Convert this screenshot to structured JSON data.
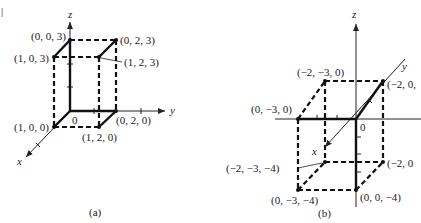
{
  "figure": {
    "margin_mark": "|",
    "panels": [
      {
        "id": "a",
        "caption": "(a)",
        "axes": {
          "x": "x",
          "y": "y",
          "z": "z",
          "origin": "0"
        },
        "vertices": [
          {
            "label": "(0, 0, 3)",
            "coords": [
              0,
              0,
              3
            ]
          },
          {
            "label": "(0, 2, 3)",
            "coords": [
              0,
              2,
              3
            ]
          },
          {
            "label": "(1, 0, 3)",
            "coords": [
              1,
              0,
              3
            ]
          },
          {
            "label": "(1, 2, 3)",
            "coords": [
              1,
              2,
              3
            ]
          },
          {
            "label": "(1, 0, 0)",
            "coords": [
              1,
              0,
              0
            ]
          },
          {
            "label": "(0, 2, 0)",
            "coords": [
              0,
              2,
              0
            ]
          },
          {
            "label": "(1, 2, 0)",
            "coords": [
              1,
              2,
              0
            ]
          }
        ]
      },
      {
        "id": "b",
        "caption": "(b)",
        "axes": {
          "x": "x",
          "y": "y",
          "z": "z",
          "origin": "0"
        },
        "vertices": [
          {
            "label": "(−2, −3, 0)",
            "coords": [
              -2,
              -3,
              0
            ]
          },
          {
            "label": "(−2, 0,",
            "coords": [
              -2,
              0,
              0
            ]
          },
          {
            "label": "(0, −3, 0)",
            "coords": [
              0,
              -3,
              0
            ]
          },
          {
            "label": "(−2, −3, −4)",
            "coords": [
              -2,
              -3,
              -4
            ]
          },
          {
            "label": "(−2, 0",
            "coords": [
              -2,
              0,
              -4
            ]
          },
          {
            "label": "(0, −3, −4)",
            "coords": [
              0,
              -3,
              -4
            ]
          },
          {
            "label": "(0, 0, −4)",
            "coords": [
              0,
              0,
              -4
            ]
          }
        ]
      }
    ]
  }
}
